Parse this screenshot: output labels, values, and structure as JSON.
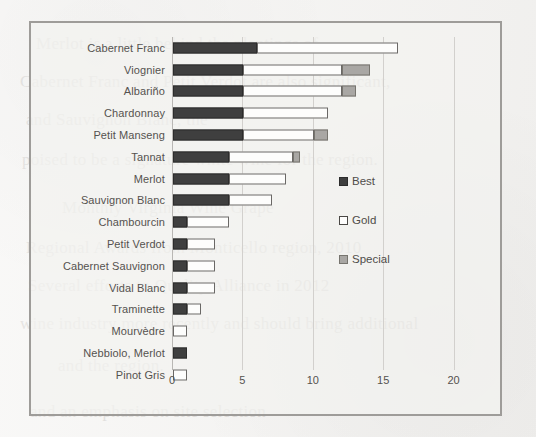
{
  "background_text": {
    "lines": [
      {
        "text": "Merlot is a little behind the plantings of",
        "x": 36,
        "y": 24
      },
      {
        "text": "Cabernet Franc and Petit Verdot are also significant,",
        "x": 20,
        "y": 62
      },
      {
        "text": "and Sauvignon Blanc, the",
        "x": 26,
        "y": 100
      },
      {
        "text": "poised to be a signature white wine for the region.",
        "x": 22,
        "y": 140
      },
      {
        "text": "Monthly Virginia Wine Grape",
        "x": 62,
        "y": 188
      },
      {
        "text": "Regional Awards from Monticello region, 2010",
        "x": 26,
        "y": 228
      },
      {
        "text": "Several efforts to Quality Alliance in 2012",
        "x": 28,
        "y": 266
      },
      {
        "text": "wine industry more recently and should bring additional",
        "x": 20,
        "y": 304
      },
      {
        "text": "and the region.",
        "x": 58,
        "y": 346
      },
      {
        "text": "and an emphasis on site selection",
        "x": 30,
        "y": 392
      }
    ]
  },
  "chart_data": {
    "type": "bar",
    "orientation": "horizontal",
    "stacked": true,
    "title": "",
    "xlabel": "",
    "ylabel": "",
    "xlim": [
      0,
      23
    ],
    "xticks": [
      0,
      5,
      10,
      15,
      20
    ],
    "grid": true,
    "legend_position": "right-inside",
    "colors": {
      "best": "#3f3f3f",
      "gold": "#fdfdfc",
      "special": "#a9a7a4",
      "frame": "#9e9c99",
      "gridline": "#d2d0cd",
      "text": "#55524f",
      "page": "#f4f3f1"
    },
    "series": [
      {
        "name": "Best",
        "values": [
          6,
          5,
          5,
          5,
          5,
          4,
          4,
          4,
          1,
          1,
          1,
          1,
          1,
          0,
          1,
          0
        ]
      },
      {
        "name": "Gold",
        "values": [
          10,
          7,
          7,
          6,
          5,
          4.5,
          4,
          3,
          3,
          2,
          2,
          2,
          1,
          1,
          0,
          1
        ]
      },
      {
        "name": "Special",
        "values": [
          0,
          2,
          1,
          0,
          1,
          0.5,
          0,
          0,
          0,
          0,
          0,
          0,
          0,
          0,
          0,
          0
        ]
      }
    ],
    "categories": [
      "Cabernet Franc",
      "Viognier",
      "Albariño",
      "Chardonnay",
      "Petit Manseng",
      "Tannat",
      "Merlot",
      "Sauvignon Blanc",
      "Chambourcin",
      "Petit Verdot",
      "Cabernet Sauvignon",
      "Vidal Blanc",
      "Traminette",
      "Mourvèdre",
      "Nebbiolo, Merlot",
      "Pinot Gris"
    ],
    "totals": [
      16,
      14,
      13,
      11,
      11,
      9,
      8,
      7,
      4,
      3,
      3,
      3,
      2,
      1,
      1,
      1
    ]
  },
  "legend": {
    "items": [
      {
        "label": "Best",
        "key": "best"
      },
      {
        "label": "Gold",
        "key": "gold"
      },
      {
        "label": "Special",
        "key": "special"
      }
    ]
  }
}
